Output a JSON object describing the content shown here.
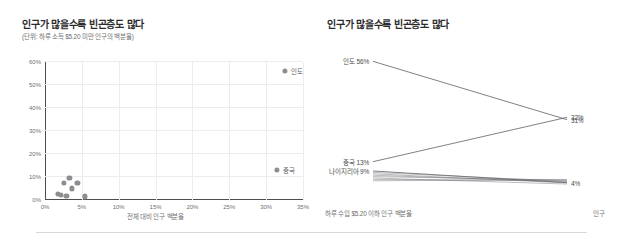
{
  "left_panel": {
    "title": "인구가 많을수록 빈곤층도 많다",
    "subtitle": "(단위: 하루 소득 $5.20 미만 인구의 백분율)",
    "xaxis_label": "전체 대비 인구 백분율"
  },
  "right_panel": {
    "title": "인구가 많을수록 빈곤층도 많다",
    "xaxis_label_left": "하루 수입 $5.20 이하 인구 백분율",
    "xaxis_label_right": "인구"
  },
  "chart_data": [
    {
      "type": "scatter",
      "title": "인구가 많을수록 빈곤층도 많다",
      "subtitle": "(단위: 하루 소득 $5.20 미만 인구의 백분율)",
      "xlabel": "전체 대비 인구 백분율",
      "ylabel": "",
      "xlim": [
        0,
        35
      ],
      "ylim": [
        0,
        60
      ],
      "xticks": [
        "0%",
        "5%",
        "10%",
        "15%",
        "20%",
        "25%",
        "30%",
        "35%"
      ],
      "xtick_values": [
        0,
        5,
        10,
        15,
        20,
        25,
        30,
        35
      ],
      "yticks": [
        "0%",
        "10%",
        "20%",
        "30%",
        "40%",
        "50%",
        "60%"
      ],
      "ytick_values": [
        0,
        10,
        20,
        30,
        40,
        50,
        60
      ],
      "grid": true,
      "legend": "none",
      "points": [
        {
          "label": "인도",
          "x": 32.5,
          "y": 56.0,
          "labeled": true
        },
        {
          "label": "중국",
          "x": 31.5,
          "y": 13.0,
          "labeled": true
        },
        {
          "label": "",
          "x": 3.3,
          "y": 9.5,
          "labeled": false
        },
        {
          "label": "",
          "x": 2.6,
          "y": 7.4,
          "labeled": false
        },
        {
          "label": "",
          "x": 4.4,
          "y": 7.2,
          "labeled": false
        },
        {
          "label": "",
          "x": 3.6,
          "y": 5.0,
          "labeled": false
        },
        {
          "label": "",
          "x": 1.8,
          "y": 2.6,
          "labeled": false
        },
        {
          "label": "",
          "x": 2.2,
          "y": 2.2,
          "labeled": false
        },
        {
          "label": "",
          "x": 2.9,
          "y": 1.7,
          "labeled": false
        },
        {
          "label": "",
          "x": 5.4,
          "y": 1.5,
          "labeled": false
        }
      ]
    },
    {
      "type": "line",
      "title": "인구가 많을수록 빈곤층도 많다",
      "xlabel": "하루 수입 $5.20 이하 인구 백분율",
      "xlabel_right": "인구",
      "categories": [
        "하루 수입 $5.20 이하 인구 백분율",
        "인구"
      ],
      "left_axis_labels": [
        "인도 56%",
        "중국 13%",
        "나이지리아 9%"
      ],
      "right_axis_labels": [
        "32%",
        "31%",
        "4%"
      ],
      "series": [
        {
          "name": "인도",
          "values": [
            56,
            31
          ],
          "left_label": "인도 56%",
          "right_label": "31%",
          "emphasis": true
        },
        {
          "name": "중국",
          "values": [
            13,
            32
          ],
          "left_label": "중국 13%",
          "right_label": "32%",
          "emphasis": true
        },
        {
          "name": "나이지리아",
          "values": [
            9,
            4
          ],
          "left_label": "나이지리아 9%",
          "right_label": "4%",
          "emphasis": true
        },
        {
          "name": "기타 1",
          "values": [
            8.4,
            4.6
          ],
          "left_label": "",
          "right_label": "",
          "emphasis": false
        },
        {
          "name": "기타 2",
          "values": [
            7.8,
            3.9
          ],
          "left_label": "",
          "right_label": "",
          "emphasis": false
        },
        {
          "name": "기타 3",
          "values": [
            7.2,
            4.3
          ],
          "left_label": "",
          "right_label": "",
          "emphasis": false
        },
        {
          "name": "기타 4",
          "values": [
            6.6,
            5.1
          ],
          "left_label": "",
          "right_label": "",
          "emphasis": false
        },
        {
          "name": "기타 5",
          "values": [
            6.0,
            3.4
          ],
          "left_label": "",
          "right_label": "",
          "emphasis": false
        },
        {
          "name": "기타 6",
          "values": [
            5.4,
            4.8
          ],
          "left_label": "",
          "right_label": "",
          "emphasis": false
        },
        {
          "name": "기타 7",
          "values": [
            4.8,
            5.4
          ],
          "left_label": "",
          "right_label": "",
          "emphasis": false
        }
      ],
      "ylim": [
        0,
        60
      ],
      "grid": false,
      "legend": "inline-labels"
    }
  ],
  "colors": {
    "line": "#6b6b72",
    "dot": "#8d8d92",
    "grid": "#ececf2",
    "axis": "#4d4d4d",
    "text": "#3c3c3c",
    "muted_text": "#6f6f6f"
  }
}
